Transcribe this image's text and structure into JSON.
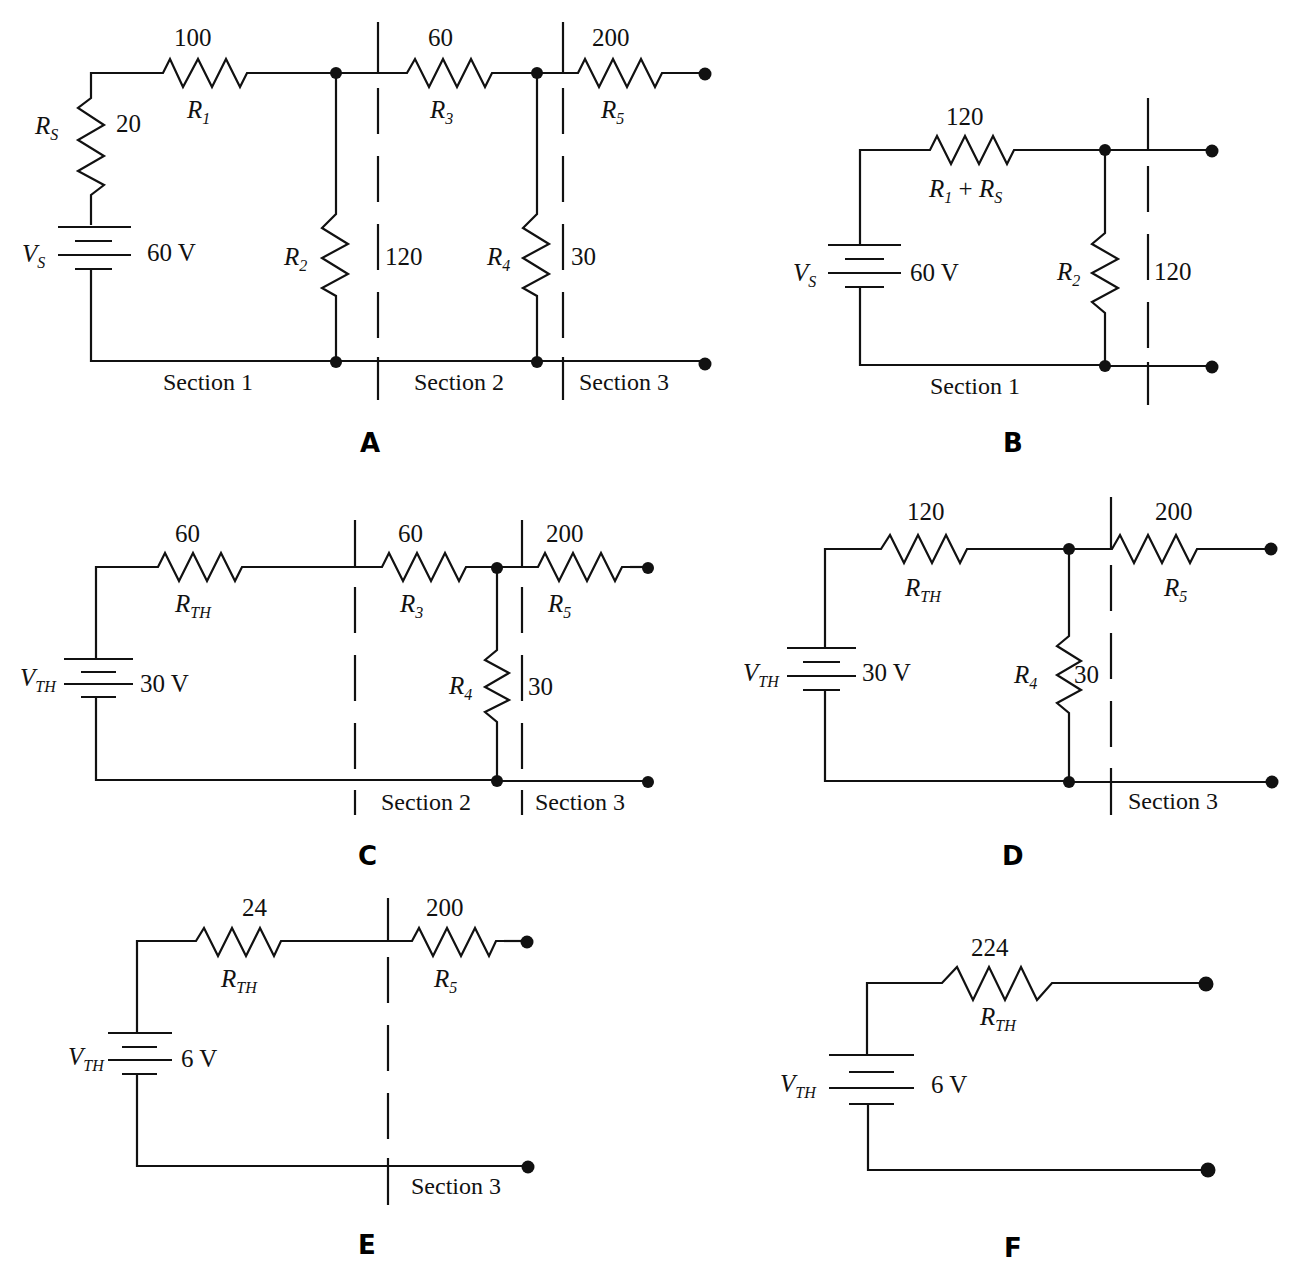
{
  "figure": {
    "panels": [
      {
        "id": "A",
        "label": "A",
        "source": {
          "name": "V",
          "sub": "S",
          "value": "60 V"
        },
        "resistors": [
          {
            "name": "R",
            "sub": "S",
            "value": "20"
          },
          {
            "name": "R",
            "sub": "1",
            "value": "100"
          },
          {
            "name": "R",
            "sub": "2",
            "value": "120"
          },
          {
            "name": "R",
            "sub": "3",
            "value": "60"
          },
          {
            "name": "R",
            "sub": "4",
            "value": "30"
          },
          {
            "name": "R",
            "sub": "5",
            "value": "200"
          }
        ],
        "sections": [
          "Section 1",
          "Section 2",
          "Section 3"
        ]
      },
      {
        "id": "B",
        "label": "B",
        "source": {
          "name": "V",
          "sub": "S",
          "value": "60 V"
        },
        "resistors": [
          {
            "name": "R",
            "sub": "1",
            "name2": "R",
            "sub2": "S",
            "plus": " + ",
            "value": "120"
          },
          {
            "name": "R",
            "sub": "2",
            "value": "120"
          }
        ],
        "sections": [
          "Section 1"
        ]
      },
      {
        "id": "C",
        "label": "C",
        "source": {
          "name": "V",
          "sub": "TH",
          "value": "30 V"
        },
        "resistors": [
          {
            "name": "R",
            "sub": "TH",
            "value": "60"
          },
          {
            "name": "R",
            "sub": "3",
            "value": "60"
          },
          {
            "name": "R",
            "sub": "4",
            "value": "30"
          },
          {
            "name": "R",
            "sub": "5",
            "value": "200"
          }
        ],
        "sections": [
          "Section 2",
          "Section 3"
        ]
      },
      {
        "id": "D",
        "label": "D",
        "source": {
          "name": "V",
          "sub": "TH",
          "value": "30 V"
        },
        "resistors": [
          {
            "name": "R",
            "sub": "TH",
            "value": "120"
          },
          {
            "name": "R",
            "sub": "4",
            "value": "30"
          },
          {
            "name": "R",
            "sub": "5",
            "value": "200"
          }
        ],
        "sections": [
          "Section 3"
        ]
      },
      {
        "id": "E",
        "label": "E",
        "source": {
          "name": "V",
          "sub": "TH",
          "value": "6 V"
        },
        "resistors": [
          {
            "name": "R",
            "sub": "TH",
            "value": "24"
          },
          {
            "name": "R",
            "sub": "5",
            "value": "200"
          }
        ],
        "sections": [
          "Section 3"
        ]
      },
      {
        "id": "F",
        "label": "F",
        "source": {
          "name": "V",
          "sub": "TH",
          "value": "6 V"
        },
        "resistors": [
          {
            "name": "R",
            "sub": "TH",
            "value": "224"
          }
        ],
        "sections": []
      }
    ]
  }
}
